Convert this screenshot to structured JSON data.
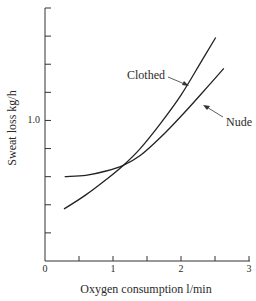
{
  "chart_data": {
    "type": "line",
    "title": "",
    "xlabel": "Oxygen consumption l/min",
    "ylabel": "Sweat loss kg/h",
    "xlim": [
      0,
      3
    ],
    "ylim": [
      0,
      1.8
    ],
    "x_ticks": [
      0,
      0.5,
      1,
      1.5,
      2,
      2.5,
      3
    ],
    "x_tick_labels": [
      {
        "value": 0,
        "label": "0"
      },
      {
        "value": 1,
        "label": "1"
      },
      {
        "value": 2,
        "label": "2"
      },
      {
        "value": 3,
        "label": "3"
      }
    ],
    "y_ticks": [
      0,
      0.2,
      0.4,
      0.6,
      0.8,
      1.0,
      1.2,
      1.4,
      1.6,
      1.8
    ],
    "y_tick_labels": [
      {
        "value": 1.0,
        "label": "1.0"
      }
    ],
    "grid": false,
    "legend": "inline annotations with arrows",
    "series": [
      {
        "name": "Clothed",
        "x": [
          0.28,
          0.6,
          0.9,
          1.15,
          1.4,
          1.7,
          2.0,
          2.3,
          2.51
        ],
        "y": [
          0.37,
          0.47,
          0.58,
          0.68,
          0.8,
          0.98,
          1.18,
          1.42,
          1.59
        ]
      },
      {
        "name": "Nude",
        "x": [
          0.29,
          0.6,
          0.9,
          1.15,
          1.4,
          1.7,
          2.0,
          2.3,
          2.63
        ],
        "y": [
          0.6,
          0.61,
          0.64,
          0.68,
          0.75,
          0.88,
          1.03,
          1.19,
          1.37
        ]
      }
    ],
    "annotations": [
      {
        "text": "Clothed",
        "series": "Clothed"
      },
      {
        "text": "Nude",
        "series": "Nude"
      }
    ]
  }
}
